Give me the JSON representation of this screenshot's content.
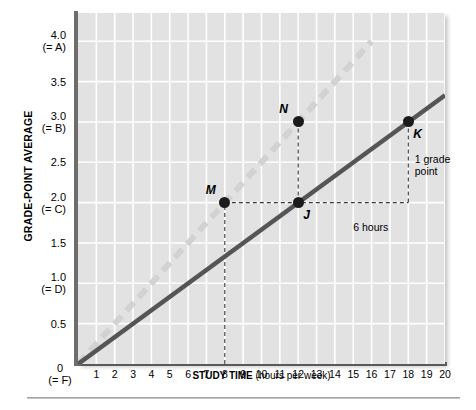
{
  "chart_data": {
    "type": "line",
    "title": "",
    "xlabel": "STUDY TIME",
    "xlabel_units": "(hours per week)",
    "ylabel": "GRADE-POINT AVERAGE",
    "xlim": [
      0,
      20
    ],
    "ylim": [
      0,
      4.35
    ],
    "grid": true,
    "legend": "none",
    "x_ticks": [
      "1",
      "2",
      "3",
      "4",
      "5",
      "6",
      "7",
      "8",
      "9",
      "10",
      "11",
      "12",
      "13",
      "14",
      "15",
      "16",
      "17",
      "18",
      "19",
      "20"
    ],
    "x_tick_values": [
      1,
      2,
      3,
      4,
      5,
      6,
      7,
      8,
      9,
      10,
      11,
      12,
      13,
      14,
      15,
      16,
      17,
      18,
      19,
      20
    ],
    "y_ticks": [
      {
        "value": 4.0,
        "line1": "4.0",
        "line2": "(= A)"
      },
      {
        "value": 3.5,
        "line1": "3.5",
        "line2": ""
      },
      {
        "value": 3.0,
        "line1": "3.0",
        "line2": "(= B)"
      },
      {
        "value": 2.5,
        "line1": "2.5",
        "line2": ""
      },
      {
        "value": 2.0,
        "line1": "2.0",
        "line2": "(= C)"
      },
      {
        "value": 1.5,
        "line1": "1.5",
        "line2": ""
      },
      {
        "value": 1.0,
        "line1": "1.0",
        "line2": "(= D)"
      },
      {
        "value": 0.5,
        "line1": "0.5",
        "line2": ""
      }
    ],
    "origin_label": {
      "line1": "0",
      "line2": "(= F)"
    },
    "series": [
      {
        "name": "steeper-dashed-line",
        "style": "dashed",
        "color": "#d2d2d2",
        "points": [
          [
            0,
            0
          ],
          [
            16,
            4.0
          ]
        ]
      },
      {
        "name": "solid-regression-line",
        "style": "solid",
        "color": "#555555",
        "points": [
          [
            0,
            0
          ],
          [
            20,
            3.33
          ]
        ]
      }
    ],
    "data_points": [
      {
        "label": "M",
        "x": 8,
        "y": 2.0,
        "label_pos": "upper-left"
      },
      {
        "label": "N",
        "x": 12,
        "y": 3.0,
        "label_pos": "upper-left"
      },
      {
        "label": "J",
        "x": 12,
        "y": 2.0,
        "label_pos": "lower-right"
      },
      {
        "label": "K",
        "x": 18,
        "y": 3.0,
        "label_pos": "lower-right"
      }
    ],
    "annotations": [
      {
        "name": "run-label",
        "text": "6 hours",
        "x": 15,
        "y": 1.77
      },
      {
        "name": "rise-label-line1",
        "text": "1 grade",
        "x": 18.35,
        "y": 2.62
      },
      {
        "name": "rise-label-line2",
        "text": "point",
        "x": 18.35,
        "y": 2.47
      }
    ],
    "guide_lines": [
      {
        "name": "m-vertical-guide",
        "from": [
          8,
          0
        ],
        "to": [
          8,
          2.0
        ]
      },
      {
        "name": "n-vertical-guide",
        "from": [
          12,
          2.0
        ],
        "to": [
          12,
          3.0
        ]
      },
      {
        "name": "mj-horizontal-guide",
        "from": [
          8,
          2.0
        ],
        "to": [
          18,
          2.0
        ]
      },
      {
        "name": "k-vertical-guide",
        "from": [
          18,
          2.0
        ],
        "to": [
          18,
          3.0
        ]
      }
    ],
    "colors": {
      "plot_background": "#e2e2e2",
      "gridline": "#ffffff",
      "axis": "#6d6d6d",
      "marker": "#1b1b1b",
      "dashed_series": "#d2d2d2",
      "solid_series": "#555555",
      "guide_line": "#3a3a3a"
    }
  }
}
